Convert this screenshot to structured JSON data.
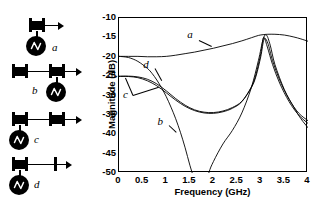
{
  "figure": {
    "panels": [
      "schematics",
      "chart"
    ]
  },
  "schematics": {
    "items": [
      {
        "id": "a",
        "label": "a",
        "description": "single resonator block with source driving it and output arrow",
        "blocks": 1,
        "source_position": "left",
        "right_terminal": "block"
      },
      {
        "id": "b",
        "label": "b",
        "description": "two resonator blocks coupled by a line, source on the right block, output arrow",
        "blocks": 2,
        "source_position": "right",
        "right_terminal": "block"
      },
      {
        "id": "c",
        "label": "c",
        "description": "two resonator blocks coupled by a line, source on the left block, output arrow",
        "blocks": 2,
        "source_position": "left",
        "right_terminal": "block"
      },
      {
        "id": "d",
        "label": "d",
        "description": "one resonator block with source, coupled by a line to an open terminal, output arrow",
        "blocks": 1,
        "source_position": "left",
        "right_terminal": "open"
      }
    ]
  },
  "chart_data": {
    "type": "line",
    "title": "",
    "xlabel": "Frequency (GHz)",
    "ylabel": "Magnitude (dB)",
    "xlim": [
      0,
      4
    ],
    "ylim": [
      -50,
      -10
    ],
    "xticks": [
      "0",
      "0.5",
      "1",
      "1.5",
      "2",
      "2.5",
      "3",
      "3.5",
      "4"
    ],
    "xtick_values": [
      0,
      0.5,
      1,
      1.5,
      2,
      2.5,
      3,
      3.5,
      4
    ],
    "yticks": [
      "-10",
      "-15",
      "-20",
      "-25",
      "-30",
      "-35",
      "-40",
      "-45",
      "-50"
    ],
    "ytick_values": [
      -10,
      -15,
      -20,
      -25,
      -30,
      -35,
      -40,
      -45,
      -50
    ],
    "grid": false,
    "legend": "inline-annotations",
    "annotations": [
      {
        "text": "a",
        "x": 1.55,
        "y": -14.8
      },
      {
        "text": "b",
        "x": 0.92,
        "y": -37.4
      },
      {
        "text": "c",
        "x": 0.19,
        "y": -30.5
      },
      {
        "text": "d",
        "x": 0.62,
        "y": -22.6
      }
    ],
    "series": [
      {
        "name": "a",
        "x": [
          0,
          0.2,
          0.4,
          0.6,
          0.8,
          1.0,
          1.2,
          1.4,
          1.6,
          1.8,
          2.0,
          2.2,
          2.4,
          2.6,
          2.8,
          2.95,
          3.05,
          3.15,
          3.3,
          3.5,
          3.7,
          3.85,
          4.0
        ],
        "y": [
          -19.9,
          -19.9,
          -19.9,
          -20.0,
          -20.0,
          -19.9,
          -19.6,
          -19.2,
          -18.8,
          -18.3,
          -17.8,
          -17.2,
          -16.6,
          -15.9,
          -15.1,
          -14.5,
          -14.3,
          -14.2,
          -14.2,
          -14.4,
          -14.9,
          -15.4,
          -16.0
        ]
      },
      {
        "name": "b",
        "x": [
          0,
          0.2,
          0.4,
          0.6,
          0.7,
          0.8,
          0.9,
          1.0,
          1.1,
          1.2,
          1.3,
          1.4,
          1.5,
          1.6,
          1.7,
          1.75,
          1.8,
          1.9,
          2.0,
          2.2,
          2.4,
          2.6,
          2.8,
          2.95,
          3.05,
          3.12,
          3.2,
          3.3,
          3.5,
          3.7,
          3.85,
          4.0
        ],
        "y": [
          -19.9,
          -20.2,
          -21.2,
          -23.0,
          -24.3,
          -26.0,
          -28.0,
          -30.3,
          -33.0,
          -36.0,
          -39.5,
          -43.5,
          -48.0,
          -52.0,
          -56.0,
          -58.0,
          -55.0,
          -50.0,
          -47.0,
          -42.5,
          -39.0,
          -34.5,
          -28.0,
          -21.0,
          -15.5,
          -14.4,
          -17.0,
          -22.0,
          -28.5,
          -33.0,
          -36.0,
          -38.3
        ]
      },
      {
        "name": "c",
        "x": [
          0,
          0.2,
          0.4,
          0.6,
          0.8,
          1.0,
          1.2,
          1.4,
          1.6,
          1.8,
          2.0,
          2.2,
          2.4,
          2.6,
          2.8,
          2.9,
          3.0,
          3.07,
          3.15,
          3.25,
          3.4,
          3.6,
          3.8,
          4.0
        ],
        "y": [
          -25.0,
          -25.0,
          -25.2,
          -25.8,
          -27.0,
          -28.8,
          -30.8,
          -32.5,
          -33.7,
          -34.3,
          -34.4,
          -34.0,
          -33.1,
          -31.5,
          -28.0,
          -25.0,
          -20.0,
          -15.5,
          -16.5,
          -21.0,
          -26.0,
          -31.0,
          -34.5,
          -36.5
        ]
      },
      {
        "name": "d",
        "x": [
          0,
          0.2,
          0.4,
          0.6,
          0.8,
          1.0,
          1.2,
          1.4,
          1.6,
          1.8,
          2.0,
          2.2,
          2.4,
          2.6,
          2.8,
          2.9,
          3.0,
          3.06,
          3.14,
          3.25,
          3.4,
          3.6,
          3.8,
          4.0
        ],
        "y": [
          -25.1,
          -25.1,
          -25.4,
          -26.2,
          -27.5,
          -29.3,
          -31.2,
          -32.8,
          -33.9,
          -34.5,
          -34.6,
          -34.2,
          -33.3,
          -31.6,
          -27.8,
          -24.5,
          -19.2,
          -15.0,
          -17.5,
          -22.0,
          -26.8,
          -31.6,
          -35.0,
          -37.2
        ]
      }
    ]
  }
}
